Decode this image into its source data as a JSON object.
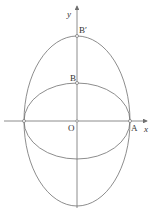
{
  "diagram": {
    "type": "coordinate-ellipses",
    "axes": {
      "x_label": "x",
      "y_label": "y"
    },
    "points": {
      "origin": "O",
      "A": "A",
      "B": "B",
      "B_prime": "B′"
    },
    "shapes": [
      {
        "name": "inner-ellipse",
        "center": "O",
        "semi_axis_x": "OA",
        "semi_axis_y": "OB"
      },
      {
        "name": "outer-ellipse",
        "center": "O",
        "semi_axis_x": "OA",
        "semi_axis_y": "OB′"
      }
    ],
    "colors": {
      "stroke": "#707070",
      "text": "#333333",
      "background": "#ffffff"
    }
  }
}
